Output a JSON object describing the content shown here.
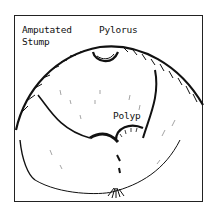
{
  "figure": {
    "labels": {
      "amputated": "Amputated",
      "stump": "Stump",
      "pylorus": "Pylorus",
      "polyp": "Polyp"
    },
    "colors": {
      "ink": "#111111",
      "background": "#ffffff"
    }
  }
}
